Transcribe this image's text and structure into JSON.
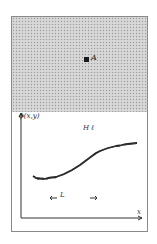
{
  "figure": {
    "top_panel": {
      "description": "stippled textured field",
      "marker_label": "A"
    },
    "plot": {
      "y_axis_label": "ϕ(x,y)",
      "x_axis_label": "x",
      "curve_label": "H ℓ",
      "length_marker": {
        "left_arrow": "←",
        "label": "L",
        "right_arrow": "→"
      }
    }
  },
  "colors": {
    "frame": "#8a8a8a",
    "stipple": "#d2d2d2",
    "ink": "#222222"
  }
}
